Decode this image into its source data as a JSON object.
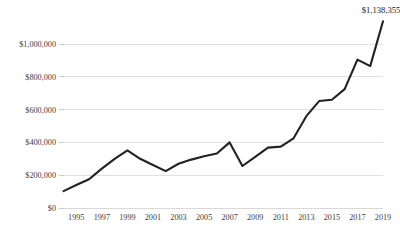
{
  "chart_data": {
    "type": "line",
    "title": "",
    "subtitle": "",
    "xlabel": "",
    "ylabel": "",
    "grid": "horizontal",
    "legend": "none",
    "xlim": [
      1994,
      2019
    ],
    "ylim": [
      0,
      1200000
    ],
    "x": [
      1994,
      1995,
      1996,
      1997,
      1998,
      1999,
      2000,
      2001,
      2002,
      2003,
      2004,
      2005,
      2006,
      2007,
      2008,
      2009,
      2010,
      2011,
      2012,
      2013,
      2014,
      2015,
      2016,
      2017,
      2018,
      2019
    ],
    "series": [
      {
        "name": "",
        "values": [
          103000,
          140000,
          175000,
          240000,
          300000,
          352000,
          300000,
          262000,
          225000,
          270000,
          295000,
          315000,
          332000,
          400000,
          256000,
          312000,
          368000,
          374000,
          425000,
          560000,
          652000,
          660000,
          725000,
          905000,
          865000,
          1138355
        ]
      }
    ],
    "ytick_labels": [
      "$1,000,000",
      "$800,000",
      "$600,000",
      "$400,000",
      "$200,000",
      "$0"
    ],
    "ytick_values": [
      1000000,
      800000,
      600000,
      400000,
      200000,
      0
    ],
    "xtick_labels": [
      "1995",
      "1997",
      "1999",
      "2001",
      "2003",
      "2005",
      "2007",
      "2009",
      "2011",
      "2013",
      "2015",
      "2017",
      "2019"
    ],
    "xtick_values": [
      1995,
      1997,
      1999,
      2001,
      2003,
      2005,
      2007,
      2009,
      2011,
      2013,
      2015,
      2017,
      2019
    ],
    "annotations": [
      {
        "label": "$1,138,355",
        "x": 2019,
        "y": 1138355
      }
    ],
    "colors": {
      "line": "#222222",
      "grid": "#d9d9d9",
      "text": "#404040",
      "background": "#ffffff"
    }
  }
}
